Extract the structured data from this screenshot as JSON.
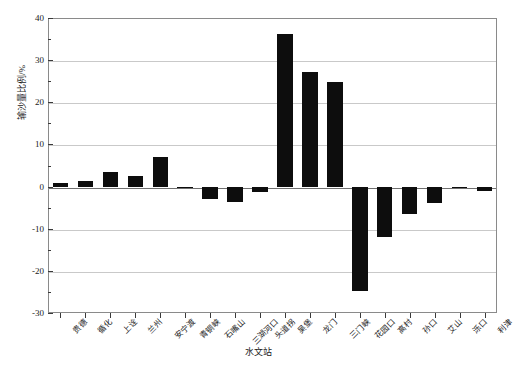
{
  "chart_data": {
    "type": "bar",
    "title": "",
    "xlabel": "水文站",
    "ylabel": "输沙量比例/%",
    "ylim": [
      -30,
      40
    ],
    "ytick_step": 10,
    "grid": true,
    "legend": "none",
    "bar_color": "#0d0d0d",
    "categories": [
      "贵德",
      "循化",
      "上诠",
      "兰州",
      "安宁渡",
      "青铜峡",
      "石嘴山",
      "三湖河口",
      "头道拐",
      "吴堡",
      "龙门",
      "三门峡",
      "花园口",
      "高村",
      "孙口",
      "艾山",
      "泺口",
      "利津"
    ],
    "values": [
      0.8,
      1.3,
      3.4,
      2.4,
      6.9,
      0.0,
      -3.0,
      -3.6,
      -1.4,
      36.2,
      27.2,
      24.8,
      -24.8,
      -12.0,
      -6.5,
      -4.0,
      -0.3,
      -1.0
    ],
    "ytick_labels": [
      "40",
      "30",
      "20",
      "10",
      "0",
      "-10",
      "-20",
      "-30"
    ],
    "ytick_values": [
      40,
      30,
      20,
      10,
      0,
      -10,
      -20,
      -30
    ]
  },
  "axis": {
    "y_title": "输沙量比例/%",
    "x_title": "水文站"
  }
}
